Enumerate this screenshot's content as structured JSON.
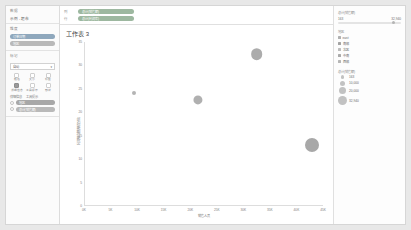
{
  "sidebar": {
    "data_section_title": "数据",
    "data_source": "示例 - 超市",
    "dimensions_title": "维度",
    "dimensions": [
      {
        "label": "订单日期",
        "type": "dim"
      },
      {
        "label": "地区",
        "type": "dim"
      }
    ],
    "marks_title": "标记",
    "mark_type": "自动",
    "mark_buttons": [
      {
        "label": "颜色",
        "icon": "color-icon"
      },
      {
        "label": "大小",
        "icon": "size-icon"
      },
      {
        "label": "标签",
        "icon": "label-icon"
      },
      {
        "label": "详细信息",
        "icon": "detail-icon"
      },
      {
        "label": "工具提示",
        "icon": "tooltip-icon"
      },
      {
        "label": "形状",
        "icon": "shape-icon"
      }
    ],
    "marks_fields_headers": [
      "详细信息",
      "工具提示"
    ],
    "marks_fields": [
      {
        "label": "地区",
        "icon": "color-swatch-icon",
        "type": "dim"
      },
      {
        "label": "总计(销售额)",
        "icon": "size-swatch-icon",
        "type": "greypale"
      }
    ]
  },
  "shelves": {
    "columns_label": "列",
    "rows_label": "行",
    "columns_pill": "总计(销售额)",
    "rows_pill": "总计(利润率)"
  },
  "worksheet": {
    "title": "工作表 3"
  },
  "legends": {
    "filter": {
      "title": "总计(销售额)",
      "min_label": "163",
      "max_label": "32,940",
      "range_label": "163 - 32,940"
    },
    "color": {
      "title": "地区",
      "items": [
        {
          "label": "east",
          "color": "#b0b0b0"
        },
        {
          "label": "南部",
          "color": "#a3a3a3"
        },
        {
          "label": "北区",
          "color": "#bdbdbd"
        },
        {
          "label": "中南",
          "color": "#aaaaaa"
        },
        {
          "label": "西部",
          "color": "#b6b6b6"
        }
      ]
    },
    "size": {
      "title": "总计(销售额)",
      "items": [
        {
          "label": "163",
          "size": 1.6
        },
        {
          "label": "10,000",
          "size": 2.6
        },
        {
          "label": "20,000",
          "size": 3.6
        },
        {
          "label": "32,940",
          "size": 4.8
        }
      ]
    }
  },
  "chart_data": {
    "type": "scatter",
    "title": "工作表 3",
    "xlabel": "销售人员",
    "ylabel": "利润额/销售额百分比",
    "xlim": [
      0,
      45000
    ],
    "ylim": [
      0,
      35
    ],
    "xticks": [
      {
        "value": 0,
        "label": "0K"
      },
      {
        "value": 5000,
        "label": "5K"
      },
      {
        "value": 10000,
        "label": "10K"
      },
      {
        "value": 15000,
        "label": "15K"
      },
      {
        "value": 20000,
        "label": "20K"
      },
      {
        "value": 25000,
        "label": "25K"
      },
      {
        "value": 30000,
        "label": "30K"
      },
      {
        "value": 35000,
        "label": "35K"
      },
      {
        "value": 40000,
        "label": "40K"
      },
      {
        "value": 45000,
        "label": "45K"
      }
    ],
    "yticks": [
      {
        "value": 0,
        "label": "0"
      },
      {
        "value": 5,
        "label": "5"
      },
      {
        "value": 10,
        "label": "10"
      },
      {
        "value": 15,
        "label": "15"
      },
      {
        "value": 20,
        "label": "20"
      },
      {
        "value": 25,
        "label": "25"
      },
      {
        "value": 30,
        "label": "30"
      },
      {
        "value": 35,
        "label": "35"
      }
    ],
    "grid": false,
    "legend_position": "right",
    "points": [
      {
        "label": "北区",
        "x": 9500,
        "y": 24.2,
        "size": 163,
        "color": "#b4b4b4"
      },
      {
        "label": "中南",
        "x": 21500,
        "y": 22.7,
        "size": 10000,
        "color": "#b0b0b0"
      },
      {
        "label": "东部",
        "x": 32500,
        "y": 32.4,
        "size": 20000,
        "color": "#acacac"
      },
      {
        "label": "西部",
        "x": 43000,
        "y": 13.0,
        "size": 32940,
        "color": "#a8a8a8"
      }
    ]
  }
}
